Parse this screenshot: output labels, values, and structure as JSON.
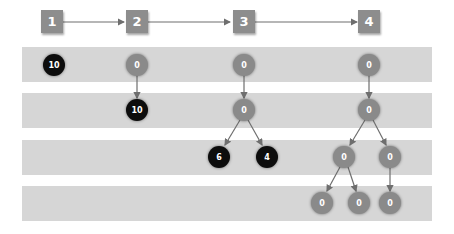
{
  "colors": {
    "band": "#d6d6d6",
    "step_box": "#8d8d8d",
    "node_grey": "#8a8a8a",
    "node_black": "#0d0d0d",
    "edge": "#6e6e6e"
  },
  "steps": [
    {
      "label": "1"
    },
    {
      "label": "2"
    },
    {
      "label": "3"
    },
    {
      "label": "4"
    }
  ],
  "columns": {
    "step1": {
      "nodes": [
        {
          "value": "10",
          "type": "black",
          "level": 1
        }
      ]
    },
    "step2": {
      "nodes": [
        {
          "value": "0",
          "type": "grey",
          "level": 1
        },
        {
          "value": "10",
          "type": "black",
          "level": 2
        }
      ]
    },
    "step3": {
      "nodes": [
        {
          "value": "0",
          "type": "grey",
          "level": 1
        },
        {
          "value": "0",
          "type": "grey",
          "level": 2
        },
        {
          "value": "6",
          "type": "black",
          "level": 3
        },
        {
          "value": "4",
          "type": "black",
          "level": 3
        }
      ]
    },
    "step4": {
      "nodes": [
        {
          "value": "0",
          "type": "grey",
          "level": 1
        },
        {
          "value": "0",
          "type": "grey",
          "level": 2
        },
        {
          "value": "0",
          "type": "grey",
          "level": 3
        },
        {
          "value": "0",
          "type": "grey",
          "level": 3
        },
        {
          "value": "0",
          "type": "grey",
          "level": 4
        },
        {
          "value": "0",
          "type": "grey",
          "level": 4
        },
        {
          "value": "0",
          "type": "grey",
          "level": 4
        }
      ]
    }
  }
}
